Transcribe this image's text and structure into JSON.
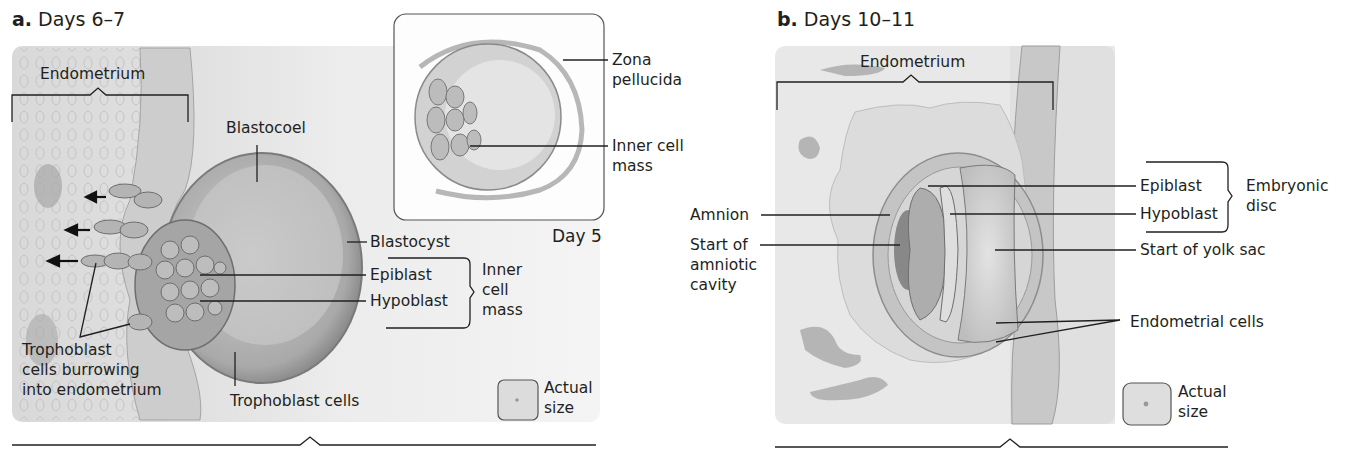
{
  "panels": [
    {
      "id": "a",
      "letter": "a.",
      "title": "Days 6–7",
      "labels": {
        "endometrium": "Endometrium",
        "blastocoel": "Blastocoel",
        "blastocyst": "Blastocyst",
        "epiblast": "Epiblast",
        "hypoblast": "Hypoblast",
        "inner_cell_mass": [
          "Inner",
          "cell",
          "mass"
        ],
        "trophoblast_burrowing": [
          "Trophoblast",
          "cells burrowing",
          "into endometrium"
        ],
        "trophoblast_cells": "Trophoblast cells",
        "actual_size": [
          "Actual",
          "size"
        ]
      },
      "inset": {
        "caption": "Day 5",
        "labels": {
          "zona_pellucida": [
            "Zona",
            "pellucida"
          ],
          "inner_cell_mass": [
            "Inner cell",
            "mass"
          ]
        }
      }
    },
    {
      "id": "b",
      "letter": "b.",
      "title": "Days 10–11",
      "labels": {
        "endometrium": "Endometrium",
        "amnion": "Amnion",
        "start_amniotic_cavity": [
          "Start of",
          "amniotic",
          "cavity"
        ],
        "epiblast": "Epiblast",
        "hypoblast": "Hypoblast",
        "embryonic_disc": [
          "Embryonic",
          "disc"
        ],
        "start_yolk_sac": "Start of yolk sac",
        "endometrial_cells": "Endometrial cells",
        "actual_size": [
          "Actual",
          "size"
        ]
      }
    }
  ],
  "colors": {
    "panel_bg": "#e6e6e6",
    "tissue": "#d4d4d4",
    "cell_dark": "#9a9a9a",
    "line": "#231f20"
  }
}
